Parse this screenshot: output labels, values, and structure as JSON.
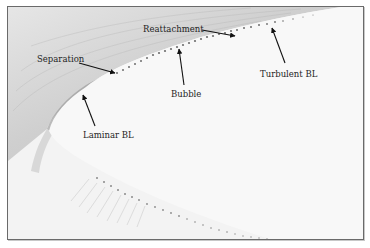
{
  "figure": {
    "labels": [
      {
        "id": "separation",
        "text": "Separation"
      },
      {
        "id": "reattachment",
        "text": "Reattachment"
      },
      {
        "id": "bubble",
        "text": "Bubble"
      },
      {
        "id": "laminar_bl",
        "text": "Laminar BL"
      },
      {
        "id": "turbulent_bl",
        "text": "Turbulent BL"
      }
    ]
  },
  "colors": {
    "frame": "#6a6a6a",
    "outer_flow": "#c9c9c9",
    "surface": "#f7f7f7",
    "arrow": "#111111"
  }
}
